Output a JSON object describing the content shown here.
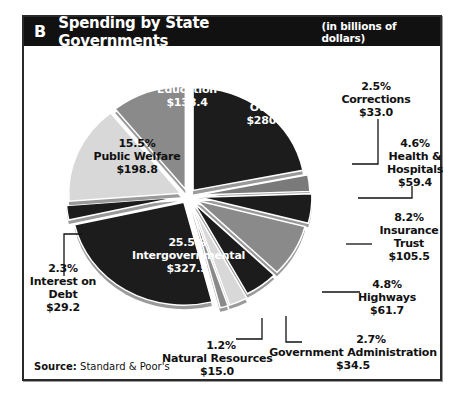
{
  "header": {
    "letter": "B",
    "title": "Spending by State Governments",
    "subtitle": "(in billions of dollars)"
  },
  "source": {
    "label": "Source:",
    "text": "Standard & Poor's"
  },
  "slices": [
    {
      "id": "other",
      "pct": "21.9%",
      "name": "Other",
      "amount": "$280.9",
      "color": "#1c1c1c"
    },
    {
      "id": "corrections",
      "pct": "2.5%",
      "name": "Corrections",
      "amount": "$33.0",
      "color": "#7a7a7a"
    },
    {
      "id": "health",
      "pct": "4.6%",
      "name_lines": [
        "Health &",
        "Hospitals"
      ],
      "amount": "$59.4",
      "color": "#1c1c1c"
    },
    {
      "id": "health_name_1",
      "value": "Health &"
    },
    {
      "id": "insurance",
      "pct": "8.2%",
      "name_lines": [
        "Insurance",
        "Trust"
      ],
      "amount": "$105.5",
      "color": "#8a8a8a"
    },
    {
      "id": "highways",
      "pct": "4.8%",
      "name": "Highways",
      "amount": "$61.7",
      "color": "#1c1c1c"
    },
    {
      "id": "govadmin",
      "pct": "2.7%",
      "name": "Government Administration",
      "amount": "$34.5",
      "color": "#d6d6d6"
    },
    {
      "id": "natres",
      "pct": "1.2%",
      "name": "Natural Resources",
      "amount": "$15.0",
      "color": "#8a8a8a"
    },
    {
      "id": "intergov",
      "pct": "25.5%",
      "name": "Intergovernmental",
      "amount": "$327.5",
      "color": "#1c1c1c"
    },
    {
      "id": "interest",
      "pct": "2.3%",
      "name_lines": [
        "Interest on",
        "Debt"
      ],
      "amount": "$29.2",
      "color": "#1c1c1c"
    },
    {
      "id": "welfare",
      "pct": "15.5%",
      "name": "Public Welfare",
      "amount": "$198.8",
      "color": "#d6d6d6"
    },
    {
      "id": "education",
      "pct": "10.8%",
      "name": "Education",
      "amount": "$138.4",
      "color": "#8a8a8a"
    }
  ],
  "labels": {
    "other": {
      "pct": "21.9%",
      "name": "Other",
      "amount": "$280.9"
    },
    "corrections": {
      "pct": "2.5%",
      "name": "Corrections",
      "amount": "$33.0"
    },
    "health": {
      "pct": "4.6%",
      "name1": "Health &",
      "name2": "Hospitals",
      "amount": "$59.4"
    },
    "insurance": {
      "pct": "8.2%",
      "name1": "Insurance",
      "name2": "Trust",
      "amount": "$105.5"
    },
    "highways": {
      "pct": "4.8%",
      "name": "Highways",
      "amount": "$61.7"
    },
    "govadmin": {
      "pct": "2.7%",
      "name": "Government Administration",
      "amount": "$34.5"
    },
    "natres": {
      "pct": "1.2%",
      "name": "Natural Resources",
      "amount": "$15.0"
    },
    "intergov": {
      "pct": "25.5%",
      "name": "Intergovernmental",
      "amount": "$327.5"
    },
    "interest": {
      "pct": "2.3%",
      "name1": "Interest on",
      "name2": "Debt",
      "amount": "$29.2"
    },
    "welfare": {
      "pct": "15.5%",
      "name": "Public Welfare",
      "amount": "$198.8"
    },
    "education": {
      "pct": "10.8%",
      "name": "Education",
      "amount": "$138.4"
    }
  },
  "chart_data": {
    "type": "pie",
    "title": "Spending by State Governments",
    "subtitle": "(in billions of dollars)",
    "panel_letter": "B",
    "categories": [
      "Other",
      "Corrections",
      "Health & Hospitals",
      "Insurance Trust",
      "Highways",
      "Government Administration",
      "Natural Resources",
      "Intergovernmental",
      "Interest on Debt",
      "Public Welfare",
      "Education"
    ],
    "values": [
      280.9,
      33.0,
      59.4,
      105.5,
      61.7,
      34.5,
      15.0,
      327.5,
      29.2,
      198.8,
      138.4
    ],
    "percentages": [
      21.9,
      2.5,
      4.6,
      8.2,
      4.8,
      2.7,
      1.2,
      25.5,
      2.3,
      15.5,
      10.8
    ],
    "units": "billions of dollars",
    "source": "Standard & Poor's",
    "exploded": true,
    "legend": "none (direct labels)"
  }
}
